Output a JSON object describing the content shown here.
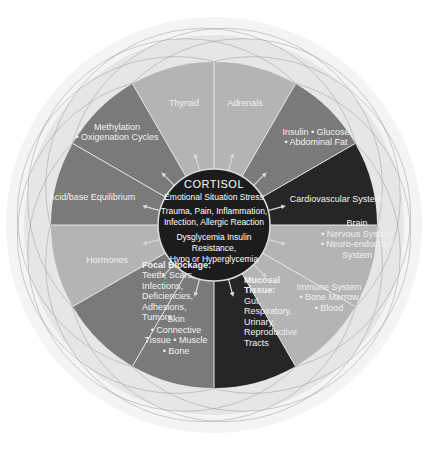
{
  "diagram": {
    "center": {
      "title": "CORTISOL",
      "lines": [
        "Emotional Situation Stress",
        "Trauma, Pain, Inflammation,",
        "Infection, Allergic Reaction",
        "Dysglycemia Insulin",
        "Resistance,",
        "Hypo or Hyperglycemia"
      ]
    },
    "segments": [
      {
        "id": "thyroid",
        "lines": [
          "Thyroid"
        ],
        "color": "#b4b4b4"
      },
      {
        "id": "adrenals",
        "lines": [
          "Adrenals"
        ],
        "color": "#b4b4b4"
      },
      {
        "id": "insulin",
        "lines": [
          "Insulin • Glucose",
          "• Abdominal Fat"
        ],
        "color": "#7a7a7a"
      },
      {
        "id": "cardiovascular",
        "lines": [
          "Cardiovascular System"
        ],
        "color": "#262626"
      },
      {
        "id": "brain",
        "lines": [
          "Brain",
          "• Nervous System",
          "• Neuro-endocrine",
          "System"
        ],
        "color": "#b4b4b4"
      },
      {
        "id": "immune",
        "lines": [
          "Immune System",
          "• Bone Marrow",
          "• Blood"
        ],
        "color": "#b4b4b4"
      },
      {
        "id": "mucosal",
        "lines": [
          "Mucosal",
          "Tissue:",
          "Gut,",
          "Respiratory,",
          "Urinary,",
          "Reproductive",
          "Tracts"
        ],
        "color": "#262626"
      },
      {
        "id": "skin",
        "lines": [
          "Skin",
          "• Connective",
          "Tissue • Muscle",
          "• Bone"
        ],
        "color": "#7a7a7a"
      },
      {
        "id": "focal",
        "lines": [
          "Focal Blockage:",
          "Teeth, Scars,",
          "Infections,",
          "Deficiencies,",
          "Adhesions,",
          "Tumors"
        ],
        "color": "#7a7a7a"
      },
      {
        "id": "hormones",
        "lines": [
          "Hormones"
        ],
        "color": "#b4b4b4"
      },
      {
        "id": "acid-base",
        "lines": [
          "Acid/base Equilibrium"
        ],
        "color": "#7a7a7a"
      },
      {
        "id": "methylation",
        "lines": [
          "Methylation",
          "• Oxigenation Cycles"
        ],
        "color": "#7a7a7a"
      }
    ],
    "colors": {
      "center_fill": "#1c1c1c",
      "halo": "#e6e6e6",
      "halo_outer": "#f2f2f2",
      "divider": "#e8e8e8",
      "ring_stroke": "#9a9a9a"
    }
  }
}
